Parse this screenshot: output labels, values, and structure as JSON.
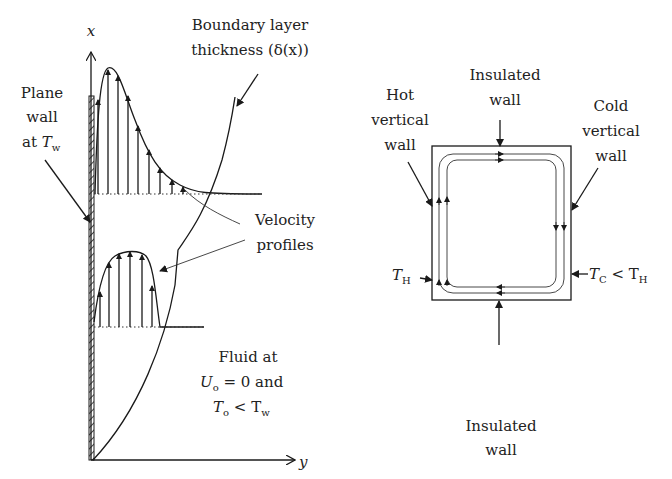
{
  "left_diagram": {
    "title": "Natural convection boundary layer on a heated vertical plate",
    "axes": {
      "x_label": "x",
      "y_label": "y"
    },
    "labels": {
      "plane_wall": [
        "Plane",
        "wall",
        "at T"
      ],
      "plane_wall_sub": "w",
      "boundary_layer": [
        "Boundary layer",
        "thickness (δ(x))"
      ],
      "velocity_profiles": [
        "Velocity",
        "profiles"
      ],
      "fluid_line1": "Fluid at",
      "fluid_U": "U",
      "fluid_U_sub": "o",
      "fluid_U_rest": " = 0 and",
      "fluid_T": "T",
      "fluid_T_sub": "o",
      "fluid_T_rest": " < T",
      "fluid_Tw_sub": "w"
    }
  },
  "right_diagram": {
    "title": "Differentially heated rectangular cavity",
    "labels": {
      "top_wall": [
        "Insulated",
        "wall"
      ],
      "bottom_wall": [
        "Insulated",
        "wall"
      ],
      "hot_wall": [
        "Hot",
        "vertical",
        "wall"
      ],
      "cold_wall": [
        "Cold",
        "vertical",
        "wall"
      ],
      "T_hot": "T",
      "T_hot_sub": "H",
      "T_cold": "T",
      "T_cold_sub": "C",
      "T_cold_rest": " < T",
      "T_cold_rest_sub": "H"
    }
  },
  "colors": {
    "ink": "#1a1a1a",
    "background": "#ffffff"
  }
}
